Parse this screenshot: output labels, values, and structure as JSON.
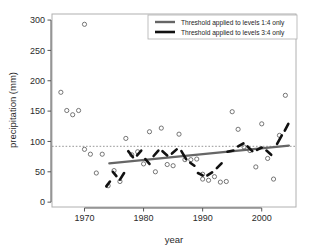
{
  "chart_data": {
    "type": "scatter",
    "title": "",
    "xlabel": "year",
    "ylabel": "precipitation (mm)",
    "xlim": [
      1964.5,
      2005.8
    ],
    "ylim": [
      -8,
      310
    ],
    "xticks": [
      1970,
      1980,
      1990,
      2000
    ],
    "yticks": [
      0,
      50,
      100,
      150,
      200,
      250,
      300
    ],
    "grid": false,
    "legend_position": "top-right",
    "series": [
      {
        "name": "observations",
        "type": "scatter",
        "marker": "open-circle",
        "color": "#555555",
        "points": [
          [
            1966,
            181
          ],
          [
            1967,
            151
          ],
          [
            1968,
            144
          ],
          [
            1969,
            151
          ],
          [
            1970,
            293
          ],
          [
            1970,
            87
          ],
          [
            1971,
            79
          ],
          [
            1972,
            48
          ],
          [
            1973,
            79
          ],
          [
            1974,
            27
          ],
          [
            1975,
            52
          ],
          [
            1976,
            34
          ],
          [
            1977,
            105
          ],
          [
            1978,
            78
          ],
          [
            1979,
            83
          ],
          [
            1980,
            63
          ],
          [
            1981,
            116
          ],
          [
            1982,
            50
          ],
          [
            1983,
            122
          ],
          [
            1984,
            62
          ],
          [
            1985,
            60
          ],
          [
            1986,
            112
          ],
          [
            1987,
            70
          ],
          [
            1988,
            70
          ],
          [
            1989,
            71
          ],
          [
            1990,
            46
          ],
          [
            1990,
            38
          ],
          [
            1991,
            36
          ],
          [
            1992,
            42
          ],
          [
            1993,
            33
          ],
          [
            1994,
            34
          ],
          [
            1995,
            149
          ],
          [
            1996,
            120
          ],
          [
            1997,
            91
          ],
          [
            1998,
            85
          ],
          [
            1999,
            58
          ],
          [
            2000,
            129
          ],
          [
            2001,
            72
          ],
          [
            2002,
            38
          ],
          [
            2003,
            110
          ],
          [
            2004,
            176
          ]
        ]
      },
      {
        "name": "Threshold applied to levels 1:4 only",
        "type": "line",
        "color": "#666666",
        "linewidth": 2.2,
        "dash": "solid",
        "x": [
          1974.2,
          2004.6
        ],
        "y": [
          64,
          93
        ]
      },
      {
        "name": "Threshold applied to levels 3:4 only",
        "type": "line",
        "color": "#111111",
        "linewidth": 2.6,
        "dash": "segmented",
        "segments": [
          [
            [
              1973.7,
              26
            ],
            [
              1974.3,
              34
            ]
          ],
          [
            [
              1974.8,
              50
            ],
            [
              1975.4,
              43
            ]
          ],
          [
            [
              1976.0,
              37
            ],
            [
              1976.7,
              48
            ]
          ],
          [
            [
              1977.4,
              84
            ],
            [
              1978.2,
              74
            ]
          ],
          [
            [
              1978.9,
              77
            ],
            [
              1979.6,
              85
            ]
          ],
          [
            [
              1980.3,
              71
            ],
            [
              1981.0,
              63
            ]
          ],
          [
            [
              1981.7,
              76
            ],
            [
              1982.5,
              85
            ]
          ],
          [
            [
              1983.2,
              84
            ],
            [
              1984.0,
              77
            ]
          ],
          [
            [
              1984.8,
              80
            ],
            [
              1985.6,
              87
            ]
          ],
          [
            [
              1986.4,
              84
            ],
            [
              1987.2,
              71
            ]
          ],
          [
            [
              1987.9,
              65
            ],
            [
              1988.6,
              60
            ]
          ],
          [
            [
              1989.2,
              48
            ],
            [
              1990.0,
              44
            ]
          ],
          [
            [
              1990.8,
              44
            ],
            [
              1991.6,
              49
            ]
          ],
          [
            [
              1992.4,
              56
            ],
            [
              1993.2,
              64
            ]
          ],
          [
            [
              1994.2,
              83
            ],
            [
              1995.2,
              85
            ]
          ],
          [
            [
              1996.0,
              92
            ],
            [
              1996.9,
              97
            ]
          ],
          [
            [
              1997.6,
              92
            ],
            [
              1998.4,
              84
            ]
          ],
          [
            [
              1999.2,
              86
            ],
            [
              2000.0,
              90
            ]
          ],
          [
            [
              2000.8,
              85
            ],
            [
              2001.6,
              78
            ]
          ],
          [
            [
              2002.6,
              96
            ],
            [
              2003.4,
              110
            ]
          ],
          [
            [
              2003.9,
              118
            ],
            [
              2004.5,
              129
            ]
          ]
        ]
      },
      {
        "name": "threshold-dotted-line",
        "type": "hline",
        "color": "#8a8a8a",
        "dash": "dotted",
        "y": 92
      }
    ]
  },
  "axes": {
    "ylabel": "precipitation (mm)",
    "xlabel": "year",
    "ytick_labels": [
      "0",
      "50",
      "100",
      "150",
      "200",
      "250",
      "300"
    ],
    "xtick_labels": [
      "1970",
      "1980",
      "1990",
      "2000"
    ]
  },
  "legend": {
    "items": [
      {
        "label": "Threshold applied to levels 1:4 only",
        "color": "#666666",
        "style": "solid"
      },
      {
        "label": "Threshold applied to levels 3:4 only",
        "color": "#111111",
        "style": "solid"
      }
    ]
  },
  "colors": {
    "plot_border": "#b0b0b0",
    "marker": "#606060",
    "trend_gray": "#666666",
    "trend_black": "#111111",
    "threshold_dotted": "#8a8a8a",
    "text": "#2b2b2b",
    "background": "#ffffff"
  }
}
